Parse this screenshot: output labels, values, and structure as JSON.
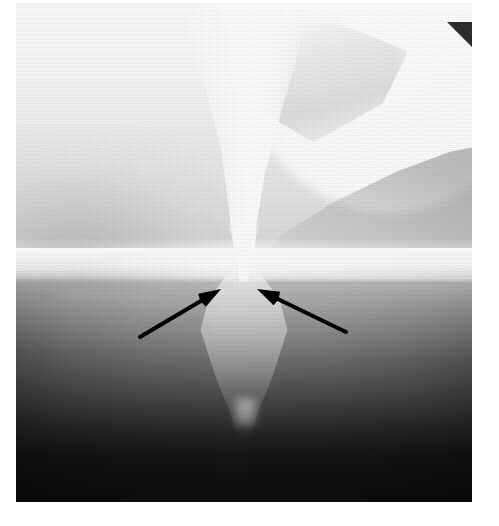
{
  "image": {
    "kind": "radiograph",
    "modality_label": "barium-swallow-radiograph",
    "view_label": "frontal",
    "alt_text": "Grayscale contrast radiograph of the upper gastrointestinal tract showing a barium-filled column that narrows to a tapered segment; two black arrows converge on the narrowing.",
    "width_px": 499,
    "height_px": 526,
    "colors": {
      "page_background": "#ffffff",
      "film_highlight": "#fdfdfd",
      "film_midtone": "#ababab",
      "film_shadow": "#0d0d0d",
      "annotation": "#000000",
      "corner_wedge": "#2e2e2e"
    },
    "plate": {
      "left_px": 16,
      "top_px": 3,
      "width_px": 456,
      "height_px": 499
    }
  },
  "regions": [
    {
      "name": "upper-field",
      "label": "Upper field (overexposed, bright)"
    },
    {
      "name": "contrast-column",
      "label": "Barium contrast column"
    },
    {
      "name": "narrowed-segment",
      "label": "Narrowed segment"
    },
    {
      "name": "collimation-band",
      "label": "Bright horizontal band"
    },
    {
      "name": "soft-tissue-mass",
      "label": "Soft tissue density, right"
    },
    {
      "name": "lower-field",
      "label": "Lower field (dark)"
    },
    {
      "name": "corner-wedge",
      "label": "Dark corner marker"
    }
  ],
  "annotations": {
    "count": 2,
    "color": "#000000",
    "stroke_width": 4,
    "head_length": 22,
    "head_width": 15,
    "arrows": [
      {
        "id": "arrow-left",
        "label": "Left marker arrow",
        "direction": "up-right",
        "tail_x": 140,
        "tail_y": 337,
        "tip_x": 221,
        "tip_y": 289
      },
      {
        "id": "arrow-right",
        "label": "Right marker arrow",
        "direction": "up-left",
        "tail_x": 346,
        "tail_y": 332,
        "tip_x": 257,
        "tip_y": 289
      }
    ]
  }
}
